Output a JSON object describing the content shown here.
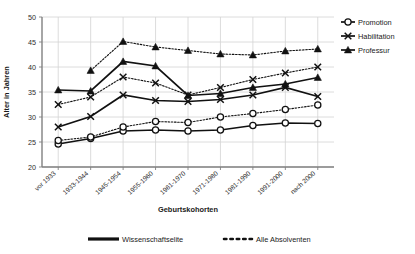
{
  "chart_data": {
    "type": "line",
    "title": "",
    "xlabel": "Geburtskohorten",
    "ylabel": "Alter in Jahren",
    "ylim": [
      20,
      50
    ],
    "ytick_step": 5,
    "yticks": [
      20,
      25,
      30,
      35,
      40,
      45,
      50
    ],
    "grid": true,
    "legend_position": "right",
    "categories": [
      "vor 1933",
      "1933-1944",
      "1945-1954",
      "1955-1960",
      "1961-1970",
      "1971-1980",
      "1981-1990",
      "1991-2000",
      "nach 2000"
    ],
    "series": [
      {
        "name": "Promotion",
        "group": "Wissenschaftselite",
        "marker": "circle",
        "line": "solid",
        "values": [
          24.6,
          25.7,
          27.2,
          27.4,
          27.2,
          27.4,
          28.3,
          28.8,
          28.7
        ]
      },
      {
        "name": "Habilitation",
        "group": "Wissenschaftselite",
        "marker": "x",
        "line": "solid",
        "values": [
          28.0,
          30.1,
          34.4,
          33.3,
          33.1,
          33.5,
          34.4,
          35.9,
          34.1
        ]
      },
      {
        "name": "Professur",
        "group": "Wissenschaftselite",
        "marker": "triangle",
        "line": "solid",
        "values": [
          35.4,
          35.2,
          41.1,
          40.2,
          34.3,
          34.7,
          35.9,
          36.6,
          37.9
        ]
      },
      {
        "name": "Promotion",
        "group": "Alle Absolventen",
        "marker": "circle",
        "line": "dotted",
        "values": [
          25.3,
          26.0,
          28.0,
          29.1,
          28.9,
          30.0,
          30.7,
          31.5,
          32.4
        ]
      },
      {
        "name": "Habilitation",
        "group": "Alle Absolventen",
        "marker": "x",
        "line": "dotted",
        "values": [
          32.5,
          34.0,
          38.0,
          36.8,
          34.4,
          35.9,
          37.5,
          38.8,
          40.0
        ]
      },
      {
        "name": "Professur",
        "group": "Alle Absolventen",
        "marker": "triangle",
        "line": "dotted",
        "values": [
          null,
          39.3,
          45.1,
          44.0,
          43.3,
          42.6,
          42.4,
          43.2,
          43.6
        ]
      }
    ]
  },
  "legend_right": {
    "items": [
      {
        "label": "Promotion",
        "marker": "circle"
      },
      {
        "label": "Habilitation",
        "marker": "x"
      },
      {
        "label": "Professur",
        "marker": "triangle"
      }
    ]
  },
  "legend_bottom": {
    "items": [
      {
        "label": "Wissenschaftselite",
        "line": "solid"
      },
      {
        "label": "Alle Absolventen",
        "line": "dotted"
      }
    ]
  },
  "axes": {
    "y_title": "Alter in Jahren",
    "x_title": "Geburtskohorten",
    "yticks": [
      "50",
      "45",
      "40",
      "35",
      "30",
      "25",
      "20"
    ]
  },
  "colors": {
    "ink": "#111111",
    "grid": "#d3d3d3",
    "axis": "#808080",
    "background": "#ffffff"
  }
}
